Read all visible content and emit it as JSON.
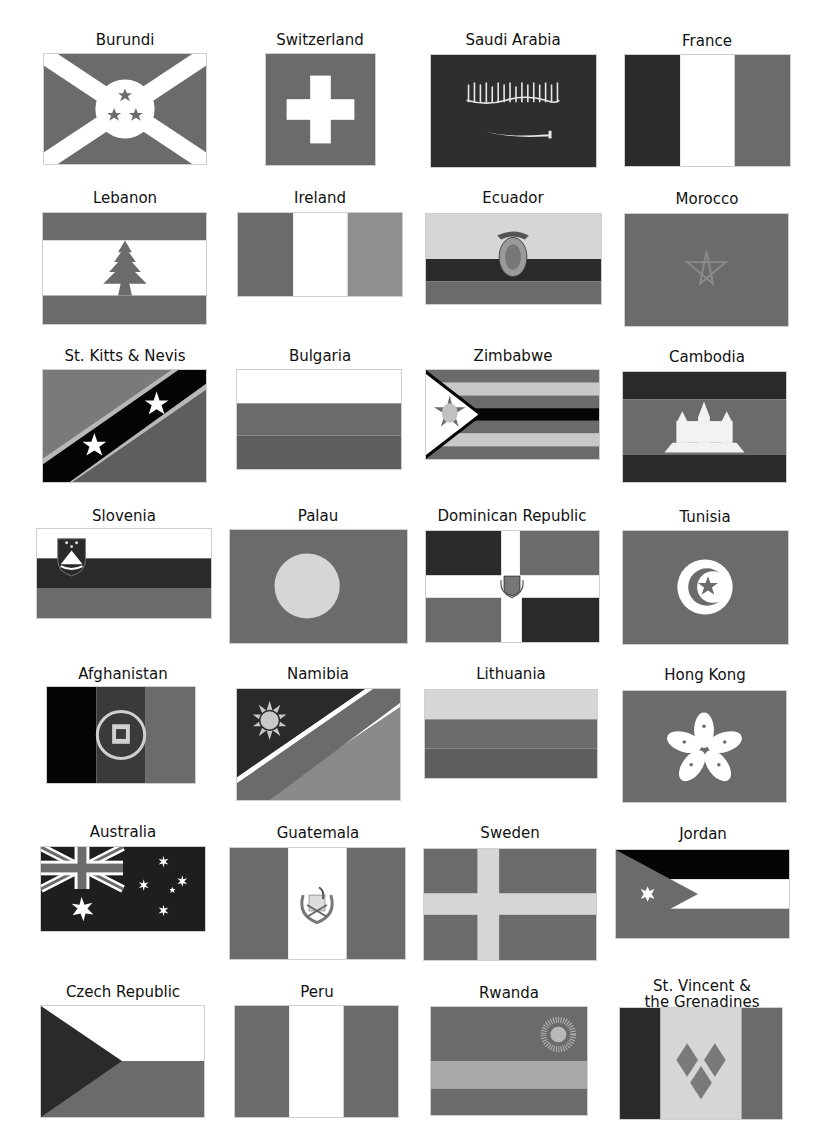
{
  "page": {
    "colors": {
      "dark": "#2a2a2a",
      "black": "#050505",
      "mid": "#6b6b6b",
      "mid_dark": "#4a4a4a",
      "light": "#8f8f8f",
      "pale": "#d6d6d6",
      "white": "#ffffff"
    },
    "flags": [
      {
        "name": "Burundi"
      },
      {
        "name": "Switzerland"
      },
      {
        "name": "Saudi Arabia"
      },
      {
        "name": "France"
      },
      {
        "name": "Lebanon"
      },
      {
        "name": "Ireland"
      },
      {
        "name": "Ecuador"
      },
      {
        "name": "Morocco"
      },
      {
        "name": "St. Kitts & Nevis"
      },
      {
        "name": "Bulgaria"
      },
      {
        "name": "Zimbabwe"
      },
      {
        "name": "Cambodia"
      },
      {
        "name": "Slovenia"
      },
      {
        "name": "Palau"
      },
      {
        "name": "Dominican Republic"
      },
      {
        "name": "Tunisia"
      },
      {
        "name": "Afghanistan"
      },
      {
        "name": "Namibia"
      },
      {
        "name": "Lithuania"
      },
      {
        "name": "Hong Kong"
      },
      {
        "name": "Australia"
      },
      {
        "name": "Guatemala"
      },
      {
        "name": "Sweden"
      },
      {
        "name": "Jordan"
      },
      {
        "name": "Czech Republic"
      },
      {
        "name": "Peru"
      },
      {
        "name": "Rwanda"
      },
      {
        "name": "St. Vincent &",
        "name_line2": "the Grenadines"
      }
    ]
  }
}
